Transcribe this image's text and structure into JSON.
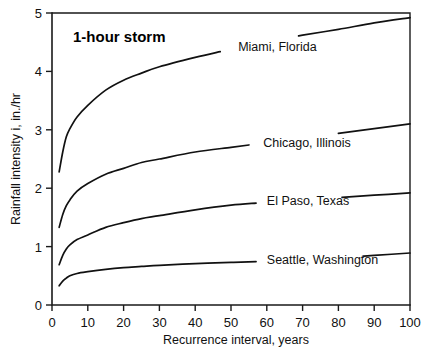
{
  "chart_data": {
    "type": "line",
    "title": "1-hour storm",
    "xlabel": "Recurrence interval, years",
    "ylabel": "Rainfall intensity i, in./hr",
    "xlim": [
      0,
      100
    ],
    "ylim": [
      0,
      5
    ],
    "grid": false,
    "legend_position": "inline-labels",
    "xticks": [
      0,
      10,
      20,
      30,
      40,
      50,
      60,
      70,
      80,
      90,
      100
    ],
    "xtick_labels": [
      "0",
      "10",
      "20",
      "30",
      "40",
      "50",
      "60",
      "70",
      "80",
      "90",
      "100"
    ],
    "yticks": [
      0,
      1,
      2,
      3,
      4,
      5
    ],
    "ytick_labels": [
      "0",
      "1",
      "2",
      "3",
      "4",
      "5"
    ],
    "x": [
      2,
      3,
      4,
      5,
      7,
      10,
      15,
      20,
      25,
      30,
      40,
      50,
      60,
      70,
      80,
      90,
      100
    ],
    "series": [
      {
        "name": "Miami, Florida",
        "label": "Miami, Florida",
        "label_x": 52,
        "label_y": 4.42,
        "gap_from_x": 47,
        "gap_to_x": 69,
        "values": [
          2.28,
          2.62,
          2.88,
          3.02,
          3.22,
          3.42,
          3.68,
          3.85,
          3.97,
          4.08,
          4.24,
          4.38,
          4.5,
          4.62,
          4.72,
          4.83,
          4.92
        ]
      },
      {
        "name": "Chicago, Illinois",
        "label": "Chicago, Illinois",
        "label_x": 59,
        "label_y": 2.78,
        "gap_from_x": 55,
        "gap_to_x": 80,
        "values": [
          1.33,
          1.55,
          1.7,
          1.8,
          1.95,
          2.08,
          2.24,
          2.34,
          2.44,
          2.5,
          2.62,
          2.7,
          2.78,
          2.86,
          2.94,
          3.02,
          3.1
        ]
      },
      {
        "name": "El Paso, Texas",
        "label": "El Paso, Texas",
        "label_x": 60,
        "label_y": 1.79,
        "gap_from_x": 57,
        "gap_to_x": 81,
        "values": [
          0.69,
          0.85,
          0.96,
          1.03,
          1.12,
          1.2,
          1.33,
          1.41,
          1.48,
          1.53,
          1.63,
          1.71,
          1.76,
          1.8,
          1.84,
          1.88,
          1.92
        ]
      },
      {
        "name": "Seattle, Washington",
        "label": "Seattle, Washington",
        "label_x": 60,
        "label_y": 0.78,
        "gap_from_x": 57,
        "gap_to_x": 87,
        "values": [
          0.33,
          0.41,
          0.46,
          0.5,
          0.54,
          0.57,
          0.61,
          0.64,
          0.66,
          0.68,
          0.71,
          0.73,
          0.75,
          0.78,
          0.81,
          0.85,
          0.89
        ]
      }
    ]
  },
  "colors": {
    "background": "#ffffff",
    "ink": "#111111",
    "axis": "#1a1a1a"
  }
}
